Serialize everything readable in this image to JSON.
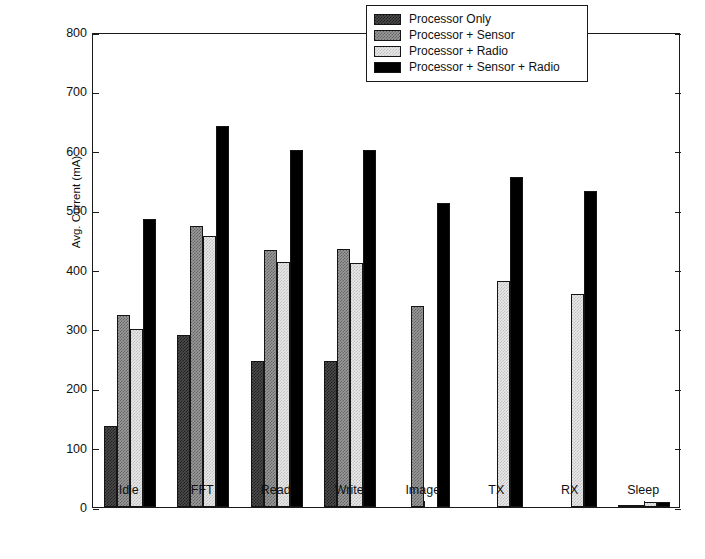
{
  "chart_data": {
    "type": "bar",
    "title": "",
    "xlabel": "",
    "ylabel": "Avg. Current (mA)",
    "ylim": [
      0,
      800
    ],
    "yticks": [
      0,
      100,
      200,
      300,
      400,
      500,
      600,
      700,
      800
    ],
    "grid": false,
    "legend_position": "top-right",
    "categories": [
      "Idle",
      "FFT",
      "Read",
      "Write",
      "Image",
      "TX",
      "RX",
      "Sleep"
    ],
    "series": [
      {
        "name": "Processor Only",
        "fill": "dark",
        "color": "#4c4c4c",
        "values": [
          136,
          290,
          246,
          246,
          0,
          0,
          0,
          3
        ]
      },
      {
        "name": "Processor + Sensor",
        "fill": "medium",
        "color": "#9a9a9a",
        "values": [
          323,
          473,
          433,
          434,
          338,
          0,
          0,
          4
        ]
      },
      {
        "name": "Processor + Radio",
        "fill": "light",
        "color": "#e8e8e8",
        "values": [
          300,
          456,
          412,
          411,
          0,
          380,
          358,
          9
        ]
      },
      {
        "name": "Processor + Sensor + Radio",
        "fill": "black",
        "color": "#000000",
        "values": [
          485,
          641,
          602,
          602,
          512,
          556,
          533,
          8
        ]
      }
    ]
  },
  "axes": {
    "y_label": "Avg. Current (mA)",
    "y_tick_labels": [
      "0",
      "100",
      "200",
      "300",
      "400",
      "500",
      "600",
      "700",
      "800"
    ],
    "x_tick_labels": [
      "Idle",
      "FFT",
      "Read",
      "Write",
      "Image",
      "TX",
      "RX",
      "Sleep"
    ]
  },
  "legend": {
    "items": [
      {
        "label": "Processor Only",
        "fill": "dark"
      },
      {
        "label": "Processor + Sensor",
        "fill": "medium"
      },
      {
        "label": "Processor + Radio",
        "fill": "light"
      },
      {
        "label": "Processor + Sensor + Radio",
        "fill": "black"
      }
    ]
  }
}
